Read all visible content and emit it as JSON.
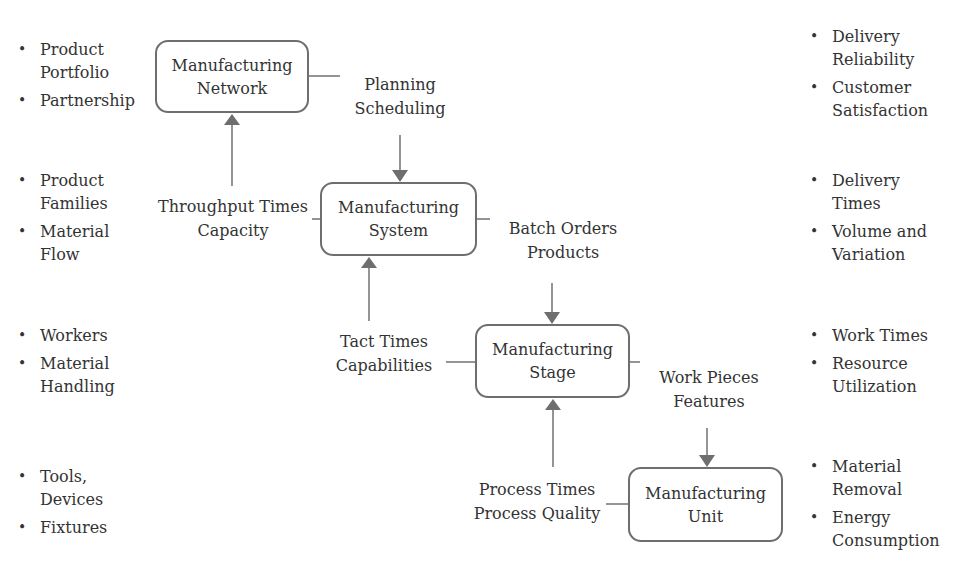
{
  "diagram": {
    "colors": {
      "line": "#6e6e6e",
      "arrow": "#6e6e6e",
      "text": "#333333",
      "background": "#ffffff"
    },
    "levels": [
      {
        "id": "network",
        "box": {
          "line1": "Manufacturing",
          "line2": "Network"
        },
        "left_bullets": [
          {
            "line1": "Product",
            "line2": "Portfolio"
          },
          {
            "line1": "Partnership",
            "line2": ""
          }
        ],
        "right_bullets": [
          {
            "line1": "Delivery",
            "line2": "Reliability"
          },
          {
            "line1": "Customer",
            "line2": "Satisfaction"
          }
        ],
        "output_down": {
          "line1": "Planning",
          "line2": "Scheduling"
        }
      },
      {
        "id": "system",
        "box": {
          "line1": "Manufacturing",
          "line2": "System"
        },
        "feedback_up": {
          "line1": "Throughput Times",
          "line2": "Capacity"
        },
        "left_bullets": [
          {
            "line1": "Product",
            "line2": "Families"
          },
          {
            "line1": "Material",
            "line2": "Flow"
          }
        ],
        "right_bullets": [
          {
            "line1": "Delivery",
            "line2": "Times"
          },
          {
            "line1": "Volume and",
            "line2": "Variation"
          }
        ],
        "output_down": {
          "line1": "Batch Orders",
          "line2": "Products"
        }
      },
      {
        "id": "stage",
        "box": {
          "line1": "Manufacturing",
          "line2": "Stage"
        },
        "feedback_up": {
          "line1": "Tact Times",
          "line2": "Capabilities"
        },
        "left_bullets": [
          {
            "line1": "Workers",
            "line2": ""
          },
          {
            "line1": "Material",
            "line2": "Handling"
          }
        ],
        "right_bullets": [
          {
            "line1": "Work Times",
            "line2": ""
          },
          {
            "line1": "Resource",
            "line2": "Utilization"
          }
        ],
        "output_down": {
          "line1": "Work Pieces",
          "line2": "Features"
        }
      },
      {
        "id": "unit",
        "box": {
          "line1": "Manufacturing",
          "line2": "Unit"
        },
        "feedback_up": {
          "line1": "Process Times",
          "line2": "Process Quality"
        },
        "left_bullets": [
          {
            "line1": "Tools,",
            "line2": "Devices"
          },
          {
            "line1": "Fixtures",
            "line2": ""
          }
        ],
        "right_bullets": [
          {
            "line1": "Material",
            "line2": "Removal"
          },
          {
            "line1": "Energy",
            "line2": "Consumption"
          }
        ]
      }
    ]
  }
}
